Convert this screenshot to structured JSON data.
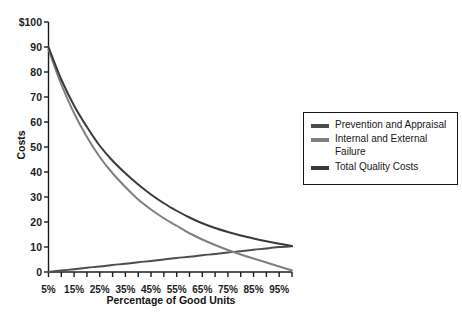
{
  "chart_data": {
    "type": "line",
    "title": "",
    "xlabel": "Percentage of Good Units",
    "ylabel": "Costs",
    "x": [
      5,
      10,
      15,
      20,
      25,
      30,
      35,
      40,
      45,
      50,
      55,
      60,
      65,
      70,
      75,
      80,
      85,
      90,
      95,
      100
    ],
    "xtick_labels": [
      "5%",
      "15%",
      "25%",
      "35%",
      "45%",
      "55%",
      "65%",
      "75%",
      "85%",
      "95%"
    ],
    "xtick_values": [
      5,
      15,
      25,
      35,
      45,
      55,
      65,
      75,
      85,
      95
    ],
    "xlim": [
      5,
      100
    ],
    "ylim": [
      0,
      100
    ],
    "ytick_labels": [
      "$100",
      "90",
      "80",
      "70",
      "60",
      "50",
      "40",
      "30",
      "20",
      "10",
      "0"
    ],
    "ytick_values": [
      100,
      90,
      80,
      70,
      60,
      50,
      40,
      30,
      20,
      10,
      0
    ],
    "grid": false,
    "legend_position": "right",
    "series": [
      {
        "name": "Prevention and Appraisal",
        "color": "#4d4d4d",
        "values": [
          0.0,
          0.6,
          1.1,
          1.7,
          2.2,
          2.8,
          3.3,
          3.9,
          4.4,
          5.0,
          5.6,
          6.1,
          6.7,
          7.2,
          7.8,
          8.3,
          8.9,
          9.4,
          10.0,
          10.3
        ]
      },
      {
        "name": "Internal and External Failure",
        "color": "#7f7f7f",
        "values": [
          89.0,
          75.0,
          63.5,
          54.0,
          46.0,
          39.5,
          34.0,
          29.0,
          25.0,
          21.5,
          18.5,
          15.5,
          13.0,
          10.8,
          8.8,
          7.0,
          5.4,
          3.8,
          2.2,
          0.6
        ]
      },
      {
        "name": "Total Quality Costs",
        "color": "#3a3a3a",
        "values": [
          90.0,
          77.0,
          66.5,
          58.0,
          50.5,
          44.5,
          39.5,
          35.0,
          31.0,
          27.5,
          24.5,
          21.8,
          19.5,
          17.6,
          16.0,
          14.6,
          13.4,
          12.3,
          11.3,
          10.4
        ]
      }
    ]
  },
  "legend": {
    "items": [
      {
        "label": "Prevention and Appraisal",
        "color": "#4d4d4d"
      },
      {
        "label": "Internal and External Failure",
        "color": "#7f7f7f"
      },
      {
        "label": "Total Quality Costs",
        "color": "#3a3a3a"
      }
    ]
  },
  "axes": {
    "x_title": "Percentage of Good Units",
    "y_title": "Costs",
    "axis_color": "#1c1c1c"
  }
}
